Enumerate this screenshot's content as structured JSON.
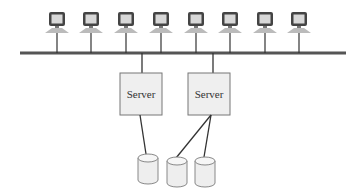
{
  "diagram": {
    "type": "network-topology",
    "colors": {
      "line": "#333333",
      "bus": "#555555",
      "server_fill": "#efefef",
      "server_stroke": "#777777",
      "disk_fill": "#eeeeee",
      "disk_stroke": "#888888",
      "monitor_frame": "#444444",
      "monitor_screen": "#d8d8d8",
      "monitor_base": "#bbbbbb"
    },
    "bus": {
      "x1": 20,
      "x2": 346,
      "y": 53
    },
    "workstations": [
      {
        "id": "ws1",
        "x": 57
      },
      {
        "id": "ws2",
        "x": 91
      },
      {
        "id": "ws3",
        "x": 126
      },
      {
        "id": "ws4",
        "x": 161
      },
      {
        "id": "ws5",
        "x": 196
      },
      {
        "id": "ws6",
        "x": 230
      },
      {
        "id": "ws7",
        "x": 265
      },
      {
        "id": "ws8",
        "x": 299
      }
    ],
    "servers": [
      {
        "id": "server1",
        "label": "Server",
        "x": 120,
        "y": 73,
        "w": 42,
        "h": 42,
        "bus_x": 142
      },
      {
        "id": "server2",
        "label": "Server",
        "x": 188,
        "y": 73,
        "w": 42,
        "h": 42,
        "bus_x": 213
      }
    ],
    "disks": [
      {
        "id": "disk1",
        "cx": 148,
        "y": 154
      },
      {
        "id": "disk2",
        "cx": 177,
        "y": 157
      },
      {
        "id": "disk3",
        "cx": 205,
        "y": 157
      }
    ],
    "connections": [
      {
        "from": "server1",
        "to": "disk1",
        "x1": 140,
        "y1": 115,
        "x2": 146,
        "y2": 154
      },
      {
        "from": "server2",
        "to": "disk2",
        "x1": 211,
        "y1": 115,
        "x2": 176,
        "y2": 158
      },
      {
        "from": "server2",
        "to": "disk3",
        "x1": 211,
        "y1": 115,
        "x2": 204,
        "y2": 157
      }
    ]
  }
}
